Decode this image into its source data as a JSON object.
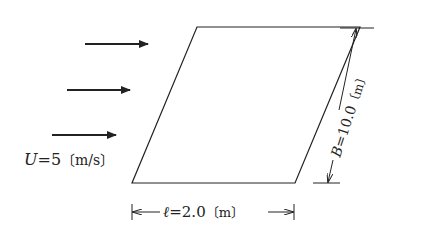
{
  "diagram": {
    "flow_label": {
      "var": "U",
      "eq": "=5",
      "unit": "〔m/s〕"
    },
    "length_label": {
      "var": "ℓ",
      "eq": "=2.0",
      "unit": "〔m〕"
    },
    "width_label": {
      "var": "B",
      "eq": "=10.0",
      "unit": "〔m〕"
    },
    "arrows_count": 3,
    "colors": {
      "line": "#222222",
      "background": "#ffffff"
    }
  }
}
